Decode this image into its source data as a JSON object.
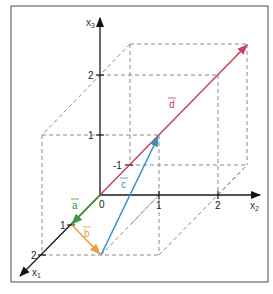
{
  "diagram": {
    "type": "3d-vector-diagram",
    "axes": {
      "x1": {
        "label": "x",
        "subscript": "1",
        "ticks": [
          "1",
          "2"
        ],
        "negative_tick": "-1"
      },
      "x2": {
        "label": "x",
        "subscript": "2",
        "ticks": [
          "1",
          "2"
        ]
      },
      "x3": {
        "label": "x",
        "subscript": "3",
        "ticks": [
          "1",
          "2"
        ]
      }
    },
    "origin_label": "0",
    "vectors": [
      {
        "name": "a",
        "label": "a",
        "color": "#3a9a3a",
        "from": [
          0,
          0,
          0
        ],
        "to": [
          1,
          0,
          0
        ]
      },
      {
        "name": "b",
        "label": "b",
        "color": "#e8a040",
        "from": [
          1,
          0,
          0
        ],
        "to": [
          2,
          1,
          0
        ]
      },
      {
        "name": "c",
        "label": "c",
        "color": "#3a8ec8",
        "from": [
          2,
          1,
          0
        ],
        "to": [
          0,
          1,
          1
        ]
      },
      {
        "name": "d",
        "label": "d",
        "color": "#d0405a",
        "from": [
          0,
          0,
          0
        ],
        "to": [
          -1,
          2,
          2
        ]
      }
    ]
  }
}
